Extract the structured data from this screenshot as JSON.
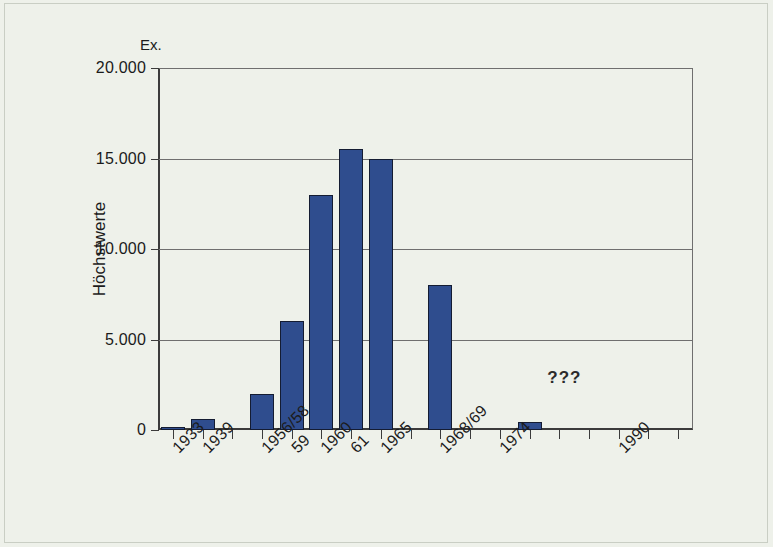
{
  "chart_data": {
    "type": "bar",
    "title": "",
    "subtitle": "",
    "unit_label": "Ex.",
    "ylabel": "Höchstwerte",
    "xlabel": "",
    "ylim": [
      0,
      20000
    ],
    "yticks": [
      0,
      5000,
      10000,
      15000,
      20000
    ],
    "ytick_labels": [
      "0",
      "5.000",
      "10.000",
      "15.000",
      "20.000"
    ],
    "grid": true,
    "legend": "none",
    "categories": [
      "1933",
      "1939",
      "1956/58",
      "59",
      "1960",
      "61",
      "1965",
      "1968/69",
      "1974",
      "1990"
    ],
    "values": [
      100,
      600,
      0,
      2000,
      6000,
      13000,
      15500,
      15000,
      8000,
      0
    ],
    "bars": [
      {
        "label": "1933",
        "value": 100,
        "slot": 0
      },
      {
        "label": "1939",
        "value": 600,
        "slot": 1
      },
      {
        "label": "1956/58",
        "value": 0,
        "slot": 2
      },
      {
        "label": "59-pre",
        "value": 2000,
        "slot": 3
      },
      {
        "label": "59",
        "value": 6000,
        "slot": 4
      },
      {
        "label": "1960",
        "value": 13000,
        "slot": 5
      },
      {
        "label": "61",
        "value": 15500,
        "slot": 6
      },
      {
        "label": "1965",
        "value": 15000,
        "slot": 7
      },
      {
        "label": "1968/69",
        "value": 8000,
        "slot": 9
      },
      {
        "label": "1974",
        "value": 450,
        "slot": 12
      }
    ],
    "xtick_slots": [
      0,
      1,
      2,
      3,
      4,
      5,
      6,
      7,
      8,
      9,
      10,
      11,
      12,
      13,
      14,
      15,
      16,
      17
    ],
    "xtick_labels": [
      {
        "text": "1933",
        "slot": 0
      },
      {
        "text": "1939",
        "slot": 1
      },
      {
        "text": "1956/58",
        "slot": 3
      },
      {
        "text": "59",
        "slot": 4
      },
      {
        "text": "1960",
        "slot": 5
      },
      {
        "text": "61",
        "slot": 6
      },
      {
        "text": "1965",
        "slot": 7
      },
      {
        "text": "1968/69",
        "slot": 9
      },
      {
        "text": "1974",
        "slot": 11
      },
      {
        "text": "1990",
        "slot": 15
      }
    ],
    "annotations": [
      {
        "text": "???",
        "x_slot": 13,
        "y_value": 2900
      }
    ],
    "colors": {
      "bar_fill": "#2f4d8e",
      "bar_border": "#141c32",
      "axis": "#3b3b3b",
      "grid": "#6f6f6f",
      "background": "#eef1ea",
      "text": "#1b1b1b"
    }
  }
}
